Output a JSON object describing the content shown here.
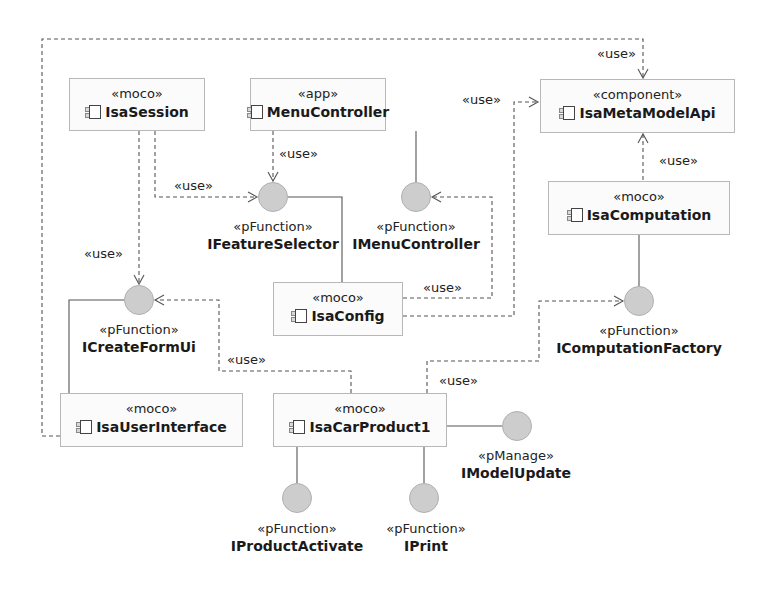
{
  "diagram": {
    "type": "UML component diagram",
    "colors": {
      "box_border": "#b8b8b8",
      "box_fill": "#fbfbfb",
      "interface_fill": "#cdcdcd",
      "line": "#555555"
    },
    "components": [
      {
        "id": "isa-session",
        "stereotype": "«moco»",
        "name": "IsaSession"
      },
      {
        "id": "menu-controller",
        "stereotype": "«app»",
        "name": "MenuController"
      },
      {
        "id": "isa-meta-model-api",
        "stereotype": "«component»",
        "name": "IsaMetaModelApi"
      },
      {
        "id": "isa-computation",
        "stereotype": "«moco»",
        "name": "IsaComputation"
      },
      {
        "id": "isa-config",
        "stereotype": "«moco»",
        "name": "IsaConfig"
      },
      {
        "id": "isa-user-interface",
        "stereotype": "«moco»",
        "name": "IsaUserInterface"
      },
      {
        "id": "isa-car-product1",
        "stereotype": "«moco»",
        "name": "IsaCarProduct1"
      }
    ],
    "interfaces": [
      {
        "id": "ifeature-selector",
        "stereotype": "«pFunction»",
        "name": "IFeatureSelector",
        "provided_by": "IsaConfig"
      },
      {
        "id": "imenu-controller",
        "stereotype": "«pFunction»",
        "name": "IMenuController",
        "provided_by": "MenuController"
      },
      {
        "id": "icreate-form-ui",
        "stereotype": "«pFunction»",
        "name": "ICreateFormUi",
        "provided_by": "IsaUserInterface"
      },
      {
        "id": "icomputation-factory",
        "stereotype": "«pFunction»",
        "name": "IComputationFactory",
        "provided_by": "IsaComputation"
      },
      {
        "id": "iproduct-activate",
        "stereotype": "«pFunction»",
        "name": "IProductActivate",
        "provided_by": "IsaCarProduct1"
      },
      {
        "id": "iprint",
        "stereotype": "«pFunction»",
        "name": "IPrint",
        "provided_by": "IsaCarProduct1"
      },
      {
        "id": "imodel-update",
        "stereotype": "«pManage»",
        "name": "IModelUpdate",
        "provided_by": "IsaCarProduct1"
      }
    ],
    "dependencies": [
      {
        "from": "IsaUserInterface",
        "to": "IsaMetaModelApi",
        "label": "«use»"
      },
      {
        "from": "IsaSession",
        "to": "ICreateFormUi",
        "label": "«use»"
      },
      {
        "from": "IsaSession",
        "to": "IFeatureSelector",
        "label": "«use»"
      },
      {
        "from": "MenuController",
        "to": "IFeatureSelector",
        "label": "«use»"
      },
      {
        "from": "IsaConfig",
        "to": "IMenuController",
        "label": "«use»"
      },
      {
        "from": "IsaConfig",
        "to": "IsaMetaModelApi",
        "label": "«use»"
      },
      {
        "from": "IsaComputation",
        "to": "IsaMetaModelApi",
        "label": "«use»"
      },
      {
        "from": "IsaCarProduct1",
        "to": "ICreateFormUi",
        "label": "«use»"
      },
      {
        "from": "IsaCarProduct1",
        "to": "IComputationFactory",
        "label": "«use»"
      }
    ],
    "use_label": "«use»"
  }
}
